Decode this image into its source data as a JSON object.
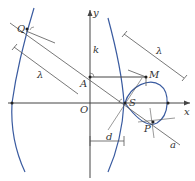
{
  "diagram": {
    "type": "geometry",
    "colors": {
      "curve": "#3a5ba0",
      "lines": "#444444",
      "background": "#ffffff"
    },
    "axes": {
      "x_label": "x",
      "y_label": "y",
      "origin_label": "O"
    },
    "points": {
      "Q": "Q",
      "A": "A",
      "M": "M",
      "S": "S",
      "P": "P"
    },
    "lengths": {
      "k": "k",
      "lambda_left": "λ",
      "lambda_right": "λ",
      "d": "d"
    },
    "line_labels": {
      "a": "a"
    }
  }
}
